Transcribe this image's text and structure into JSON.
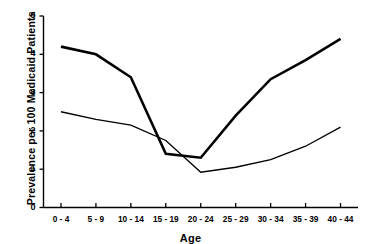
{
  "chart_data": {
    "type": "line",
    "title": "",
    "xlabel": "Age",
    "ylabel": "Prevalence per 100 Medicaid Patients",
    "categories": [
      "0 - 4",
      "5 - 9",
      "10 - 14",
      "15 - 19",
      "20 - 24",
      "25 - 29",
      "30 - 34",
      "35 - 39",
      "40 - 44"
    ],
    "ylim": [
      0,
      5
    ],
    "yticks": [
      "0",
      "1",
      "2",
      "3",
      "4",
      "5"
    ],
    "grid": false,
    "legend": "none",
    "series": [
      {
        "name": "thick-line",
        "line_weight": "thick",
        "color": "#000000",
        "values": [
          4.2,
          4.0,
          3.4,
          1.4,
          1.3,
          2.4,
          3.35,
          3.85,
          4.4
        ]
      },
      {
        "name": "thin-line",
        "line_weight": "thin",
        "color": "#000000",
        "values": [
          2.5,
          2.3,
          2.15,
          1.75,
          0.92,
          1.05,
          1.25,
          1.6,
          2.1
        ]
      }
    ]
  }
}
